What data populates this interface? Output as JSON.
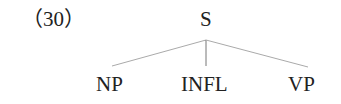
{
  "example_number": "（30）",
  "tree": {
    "root": {
      "label": "S"
    },
    "children": [
      {
        "label": "NP"
      },
      {
        "label": "INFL"
      },
      {
        "label": "VP"
      }
    ]
  },
  "colors": {
    "text": "#222222",
    "edges": "#aaaaaa",
    "background": "#ffffff"
  }
}
